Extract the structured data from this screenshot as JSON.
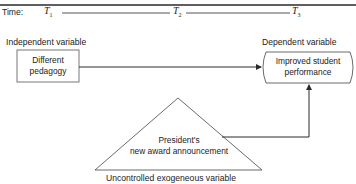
{
  "diagram": {
    "timeline": {
      "label": "Time:",
      "points": [
        {
          "name": "T",
          "sub": "1"
        },
        {
          "name": "T",
          "sub": "2"
        },
        {
          "name": "T",
          "sub": "3"
        }
      ]
    },
    "independent": {
      "heading": "Independent variable",
      "box_line1": "Different",
      "box_line2": "pedagogy"
    },
    "dependent": {
      "heading": "Dependent variable",
      "box_line1": "Improved student",
      "box_line2": "performance"
    },
    "exogenous": {
      "triangle_line1": "President's",
      "triangle_line2": "new award announcement",
      "caption": "Uncontrolled exogeneous variable"
    },
    "colors": {
      "stroke": "#2a2a2a",
      "text": "#222222",
      "background": "#ffffff"
    }
  }
}
